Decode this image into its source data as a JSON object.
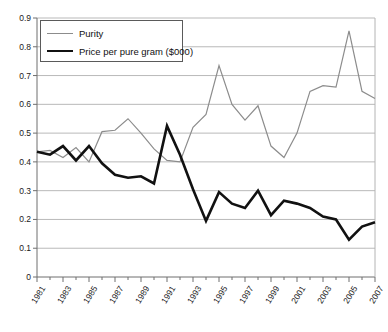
{
  "chart_data": {
    "type": "line",
    "title": "",
    "xlabel": "",
    "ylabel": "",
    "ylim": [
      0,
      0.9
    ],
    "ytick_step": 0.1,
    "yticks": [
      "0",
      "0.1",
      "0.2",
      "0.3",
      "0.4",
      "0.5",
      "0.6",
      "0.7",
      "0.8",
      "0.9"
    ],
    "grid": true,
    "grid_axis": "y",
    "legend_position": "top-left",
    "x": [
      1981,
      1982,
      1983,
      1984,
      1985,
      1986,
      1987,
      1988,
      1989,
      1990,
      1991,
      1992,
      1993,
      1994,
      1995,
      1996,
      1997,
      1998,
      1999,
      2000,
      2001,
      2002,
      2003,
      2004,
      2005,
      2006,
      2007
    ],
    "xtick_labels": [
      "1981",
      "1983",
      "1985",
      "1987",
      "1989",
      "1991",
      "1993",
      "1995",
      "1997",
      "1999",
      "2001",
      "2003",
      "2005",
      "2007"
    ],
    "xtick_labels_all": [
      "1981",
      "",
      "1983",
      "",
      "1985",
      "",
      "1987",
      "",
      "1989",
      "",
      "1991",
      "",
      "1993",
      "",
      "1995",
      "",
      "1997",
      "",
      "1999",
      "",
      "2001",
      "",
      "2003",
      "",
      "2005",
      "",
      "2007"
    ],
    "series": [
      {
        "name": "Purity",
        "color": "#8c8c8c",
        "width": 1.2,
        "values": [
          0.435,
          0.44,
          0.415,
          0.45,
          0.4,
          0.505,
          0.51,
          0.55,
          0.5,
          0.445,
          0.405,
          0.4,
          0.52,
          0.565,
          0.735,
          0.6,
          0.545,
          0.595,
          0.455,
          0.415,
          0.5,
          0.645,
          0.665,
          0.66,
          0.855,
          0.645,
          0.62
        ]
      },
      {
        "name": "Price per pure gram ($000)",
        "color": "#111111",
        "width": 2.6,
        "values": [
          0.435,
          0.425,
          0.455,
          0.405,
          0.455,
          0.395,
          0.355,
          0.345,
          0.35,
          0.325,
          0.525,
          0.425,
          0.305,
          0.195,
          0.295,
          0.255,
          0.24,
          0.3,
          0.215,
          0.265,
          0.255,
          0.24,
          0.21,
          0.2,
          0.13,
          0.175,
          0.19
        ]
      }
    ]
  },
  "legend": {
    "items": [
      {
        "label": "Purity",
        "style": "thin"
      },
      {
        "label": "Price per pure gram ($000)",
        "style": "thick"
      }
    ]
  }
}
